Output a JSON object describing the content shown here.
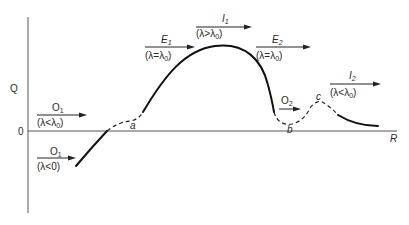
{
  "diagram": {
    "axes": {
      "y_label": "Q",
      "x_label": "R",
      "origin_label": "0"
    },
    "points": [
      {
        "id": "a",
        "label": "a"
      },
      {
        "id": "b",
        "label": "b"
      },
      {
        "id": "c",
        "label": "c"
      }
    ],
    "regions": [
      {
        "id": "o1_neg",
        "name": "O",
        "sub": "1",
        "condition": "(λ<0)",
        "cond_main": "(λ<0)"
      },
      {
        "id": "o1_low",
        "name": "O",
        "sub": "1",
        "cond_pre": "(λ<λ",
        "cond_sub": "0",
        "cond_post": ")"
      },
      {
        "id": "e1",
        "name": "E",
        "sub": "1",
        "cond_pre": "(λ=λ",
        "cond_sub": "0",
        "cond_post": ")"
      },
      {
        "id": "i1",
        "name": "I",
        "sub": "1",
        "cond_pre": "(λ>λ",
        "cond_sub": "0",
        "cond_post": ")"
      },
      {
        "id": "e2",
        "name": "E",
        "sub": "2",
        "cond_pre": "(λ=λ",
        "cond_sub": "0",
        "cond_post": ")"
      },
      {
        "id": "o2",
        "name": "O",
        "sub": "2"
      },
      {
        "id": "i2",
        "name": "I",
        "sub": "2",
        "cond_pre": "(λ<λ",
        "cond_sub": "0",
        "cond_post": ")"
      }
    ],
    "colors": {
      "curve": "#111111",
      "axis": "#555555",
      "background": "#ffffff"
    }
  }
}
